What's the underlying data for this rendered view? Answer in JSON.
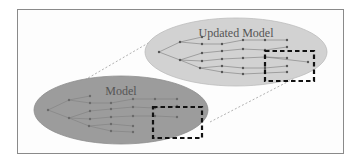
{
  "diagram": {
    "colors": {
      "background": "#ffffff",
      "frame_border": "#8a8a8a",
      "updated_model_fill": "#d2d2d2",
      "model_fill": "#9c9c9c",
      "node": "#555555",
      "edge": "#6a6a6a",
      "highlight_box": "#111111",
      "connector": "#a8a8a8",
      "label": "#555555"
    },
    "updated_model": {
      "label": "Updated Model",
      "ellipse": {
        "cx": 236,
        "cy": 52,
        "rx": 91,
        "ry": 34
      }
    },
    "model": {
      "label": "Model",
      "ellipse": {
        "cx": 121,
        "cy": 110,
        "rx": 87,
        "ry": 34
      }
    }
  }
}
